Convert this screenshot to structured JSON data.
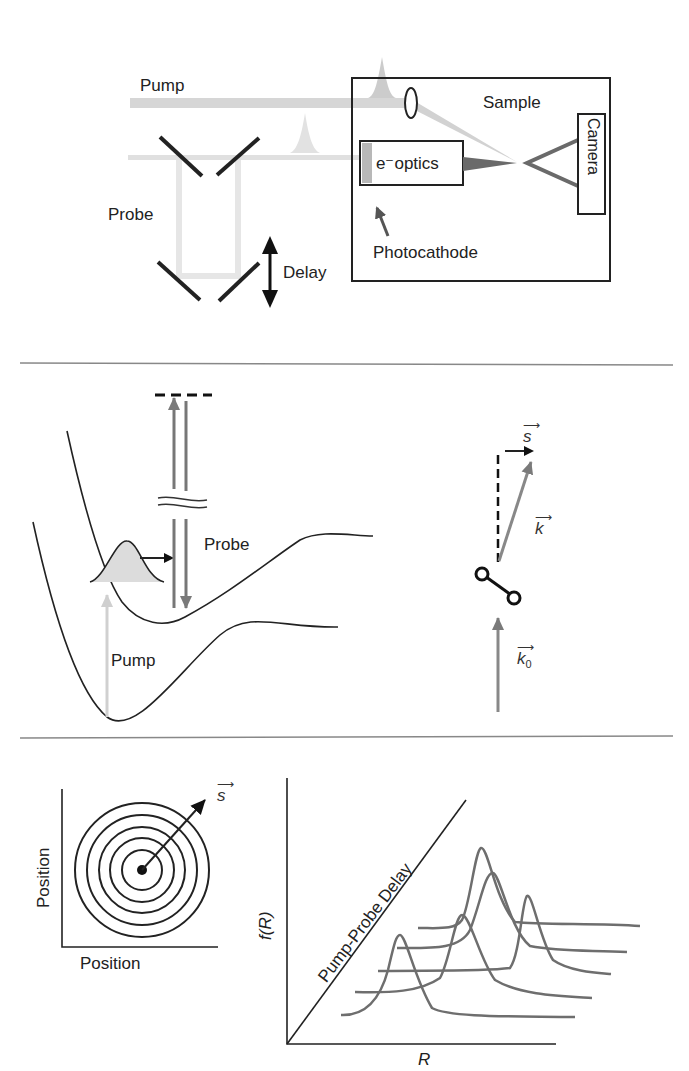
{
  "panel_setup": {
    "pump_label": "Pump",
    "probe_label": "Probe",
    "delay_label": "Delay",
    "sample_label": "Sample",
    "optics_label": "e⁻optics",
    "camera_label": "Camera",
    "photocathode_label": "Photocathode"
  },
  "panel_potential": {
    "probe_label": "Probe",
    "pump_label": "Pump",
    "vector_s": "s",
    "vector_k": "k",
    "vector_k0": "k",
    "vector_k0_sub": "0"
  },
  "panel_diffraction": {
    "x_axis_label": "Position",
    "y_axis_label": "Position",
    "vector_s": "s"
  },
  "panel_distribution": {
    "x_axis_label": "R",
    "y_axis_label": "f(R)",
    "delay_axis_label": "Pump-Probe Delay"
  },
  "colors": {
    "line": "#222222",
    "beam_light": "#d4d4d4",
    "beam_gray": "#7a7a7a",
    "curve_gray": "#6e6e6e",
    "divider": "#888888"
  }
}
